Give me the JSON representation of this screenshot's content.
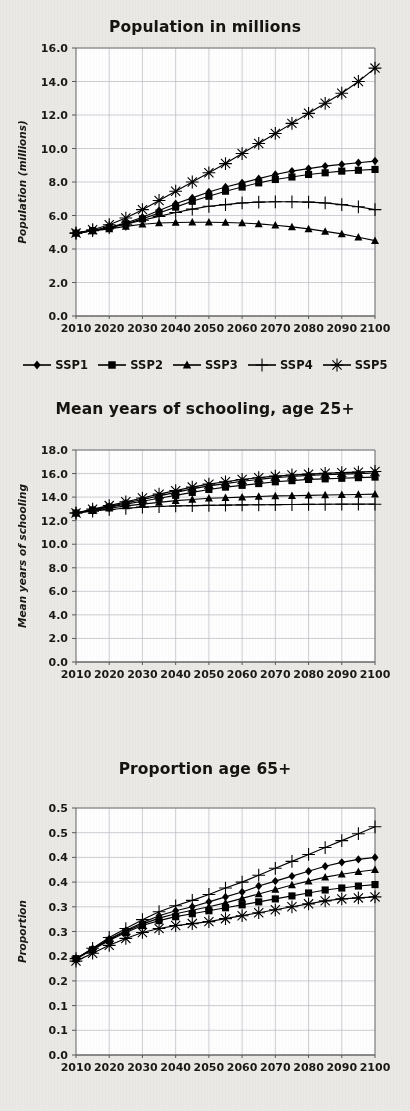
{
  "figure": {
    "background_color": "#eceae6",
    "plot_background_color": "#ffffff",
    "series_color": "#000000",
    "gridline_color": "#b9bcc4"
  },
  "legend": {
    "position": "below-first-chart",
    "items": [
      {
        "label": "SSP1",
        "marker": "diamond"
      },
      {
        "label": "SSP2",
        "marker": "square"
      },
      {
        "label": "SSP3",
        "marker": "triangle"
      },
      {
        "label": "SSP4",
        "marker": "plus"
      },
      {
        "label": "SSP5",
        "marker": "asterisk"
      }
    ]
  },
  "charts": [
    {
      "id": "population",
      "title": "Population in millions",
      "type": "line",
      "xlabel": "",
      "ylabel": "Population (millions)",
      "x": [
        2010,
        2015,
        2020,
        2025,
        2030,
        2035,
        2040,
        2045,
        2050,
        2055,
        2060,
        2065,
        2070,
        2075,
        2080,
        2085,
        2090,
        2095,
        2100
      ],
      "xticks": [
        "2010",
        "2020",
        "2030",
        "2040",
        "2050",
        "2060",
        "2070",
        "2080",
        "2090",
        "2100"
      ],
      "xlim": [
        2010,
        2100
      ],
      "ylim": [
        0.0,
        16.0
      ],
      "yticks": [
        "0.0",
        "2.0",
        "4.0",
        "6.0",
        "8.0",
        "10.0",
        "12.0",
        "14.0",
        "16.0"
      ],
      "grid": true,
      "series": [
        {
          "name": "SSP1",
          "marker": "diamond",
          "values": [
            4.95,
            5.1,
            5.3,
            5.55,
            5.9,
            6.3,
            6.7,
            7.05,
            7.4,
            7.7,
            7.95,
            8.2,
            8.45,
            8.65,
            8.8,
            8.95,
            9.05,
            9.15,
            9.25
          ]
        },
        {
          "name": "SSP2",
          "marker": "square",
          "values": [
            4.95,
            5.1,
            5.28,
            5.5,
            5.8,
            6.15,
            6.5,
            6.85,
            7.15,
            7.45,
            7.7,
            7.95,
            8.15,
            8.3,
            8.45,
            8.55,
            8.65,
            8.7,
            8.75
          ]
        },
        {
          "name": "SSP3",
          "marker": "triangle",
          "values": [
            4.95,
            5.08,
            5.2,
            5.35,
            5.48,
            5.55,
            5.58,
            5.6,
            5.6,
            5.58,
            5.55,
            5.5,
            5.42,
            5.32,
            5.2,
            5.05,
            4.9,
            4.7,
            4.5
          ]
        },
        {
          "name": "SSP4",
          "marker": "plus",
          "values": [
            4.95,
            5.1,
            5.28,
            5.48,
            5.72,
            5.95,
            6.18,
            6.38,
            6.55,
            6.65,
            6.75,
            6.8,
            6.82,
            6.82,
            6.8,
            6.75,
            6.65,
            6.52,
            6.35
          ]
        },
        {
          "name": "SSP5",
          "marker": "asterisk",
          "values": [
            4.95,
            5.15,
            5.45,
            5.85,
            6.35,
            6.9,
            7.45,
            8.0,
            8.55,
            9.1,
            9.7,
            10.3,
            10.9,
            11.5,
            12.1,
            12.7,
            13.3,
            14.0,
            14.8
          ]
        }
      ]
    },
    {
      "id": "schooling",
      "title": "Mean years of schooling, age 25+",
      "type": "line",
      "xlabel": "",
      "ylabel": "Mean years of schooling",
      "x": [
        2010,
        2015,
        2020,
        2025,
        2030,
        2035,
        2040,
        2045,
        2050,
        2055,
        2060,
        2065,
        2070,
        2075,
        2080,
        2085,
        2090,
        2095,
        2100
      ],
      "xticks": [
        "2010",
        "2020",
        "2030",
        "2040",
        "2050",
        "2060",
        "2070",
        "2080",
        "2090",
        "2100"
      ],
      "xlim": [
        2010,
        2100
      ],
      "ylim": [
        0.0,
        18.0
      ],
      "yticks": [
        "0.0",
        "2.0",
        "4.0",
        "6.0",
        "8.0",
        "10.0",
        "12.0",
        "14.0",
        "16.0",
        "18.0"
      ],
      "grid": true,
      "series": [
        {
          "name": "SSP1",
          "marker": "diamond",
          "values": [
            12.65,
            12.95,
            13.2,
            13.5,
            13.8,
            14.1,
            14.4,
            14.7,
            14.95,
            15.15,
            15.35,
            15.5,
            15.65,
            15.75,
            15.85,
            15.9,
            15.95,
            16.0,
            16.05
          ]
        },
        {
          "name": "SSP2",
          "marker": "square",
          "values": [
            12.65,
            12.9,
            13.15,
            13.4,
            13.65,
            13.9,
            14.15,
            14.4,
            14.65,
            14.85,
            15.0,
            15.15,
            15.3,
            15.4,
            15.5,
            15.55,
            15.6,
            15.65,
            15.7
          ]
        },
        {
          "name": "SSP3",
          "marker": "triangle",
          "values": [
            12.65,
            12.85,
            13.05,
            13.25,
            13.4,
            13.55,
            13.7,
            13.8,
            13.9,
            13.95,
            14.0,
            14.05,
            14.1,
            14.12,
            14.15,
            14.18,
            14.2,
            14.22,
            14.25
          ]
        },
        {
          "name": "SSP4",
          "marker": "plus",
          "values": [
            12.65,
            12.8,
            12.95,
            13.05,
            13.15,
            13.2,
            13.25,
            13.28,
            13.3,
            13.32,
            13.34,
            13.35,
            13.36,
            13.37,
            13.38,
            13.39,
            13.4,
            13.4,
            13.4
          ]
        },
        {
          "name": "SSP5",
          "marker": "asterisk",
          "values": [
            12.65,
            12.98,
            13.28,
            13.6,
            13.92,
            14.25,
            14.55,
            14.85,
            15.1,
            15.3,
            15.5,
            15.65,
            15.78,
            15.88,
            15.95,
            16.02,
            16.08,
            16.12,
            16.18
          ]
        }
      ]
    },
    {
      "id": "proportion65",
      "title": "Proportion age 65+",
      "type": "line",
      "xlabel": "",
      "ylabel": "Proportion",
      "x": [
        2010,
        2015,
        2020,
        2025,
        2030,
        2035,
        2040,
        2045,
        2050,
        2055,
        2060,
        2065,
        2070,
        2075,
        2080,
        2085,
        2090,
        2095,
        2100
      ],
      "xticks": [
        "2010",
        "2020",
        "2030",
        "2040",
        "2050",
        "2060",
        "2070",
        "2080",
        "2090",
        "2100"
      ],
      "xlim": [
        2010,
        2100
      ],
      "ylim": [
        0.0,
        0.5
      ],
      "yticks": [
        "0.0",
        "0.1",
        "0.1",
        "0.2",
        "0.2",
        "0.3",
        "0.3",
        "0.4",
        "0.4",
        "0.5",
        "0.5"
      ],
      "ytick_values": [
        0.0,
        0.05,
        0.1,
        0.15,
        0.2,
        0.25,
        0.3,
        0.35,
        0.4,
        0.45,
        0.5
      ],
      "grid": true,
      "series": [
        {
          "name": "SSP1",
          "marker": "diamond",
          "values": [
            0.195,
            0.215,
            0.235,
            0.252,
            0.268,
            0.282,
            0.292,
            0.3,
            0.31,
            0.32,
            0.33,
            0.342,
            0.352,
            0.362,
            0.372,
            0.382,
            0.39,
            0.396,
            0.4
          ]
        },
        {
          "name": "SSP2",
          "marker": "square",
          "values": [
            0.195,
            0.213,
            0.232,
            0.248,
            0.262,
            0.272,
            0.28,
            0.286,
            0.292,
            0.298,
            0.304,
            0.31,
            0.316,
            0.322,
            0.328,
            0.334,
            0.338,
            0.342,
            0.345
          ]
        },
        {
          "name": "SSP3",
          "marker": "triangle",
          "values": [
            0.195,
            0.214,
            0.234,
            0.25,
            0.265,
            0.277,
            0.286,
            0.293,
            0.3,
            0.308,
            0.317,
            0.326,
            0.335,
            0.344,
            0.352,
            0.36,
            0.366,
            0.371,
            0.375
          ]
        },
        {
          "name": "SSP4",
          "marker": "plus",
          "values": [
            0.195,
            0.216,
            0.238,
            0.256,
            0.274,
            0.29,
            0.302,
            0.313,
            0.325,
            0.338,
            0.35,
            0.364,
            0.378,
            0.392,
            0.406,
            0.42,
            0.434,
            0.448,
            0.462
          ]
        },
        {
          "name": "SSP5",
          "marker": "asterisk",
          "values": [
            0.19,
            0.206,
            0.222,
            0.236,
            0.248,
            0.256,
            0.262,
            0.266,
            0.27,
            0.276,
            0.282,
            0.288,
            0.294,
            0.3,
            0.306,
            0.312,
            0.316,
            0.318,
            0.32
          ]
        }
      ]
    }
  ]
}
